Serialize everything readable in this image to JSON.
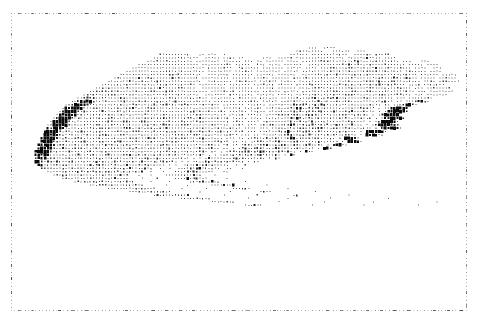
{
  "figure": {
    "title": "",
    "type": "dot-density-symbol-map",
    "subject": "Massachusetts",
    "background_color": "#ffffff",
    "symbol_color": "#0a0a0a",
    "frame_color": "#9a9a9a",
    "width": 485,
    "height": 326
  },
  "plot_frame": {
    "left": 11,
    "top": 13,
    "width": 456,
    "height": 298,
    "style": "dashed",
    "visible": true,
    "tick_count_horizontal": 34,
    "tick_count_vertical": 22
  },
  "grid": {
    "cell_width": 3.04,
    "cell_height": 3.35,
    "cols": 150,
    "rows": 89,
    "origin_x": 0,
    "origin_y": 0
  },
  "legend": {
    "visible": false,
    "levels": [
      {
        "code": 0,
        "label": "none",
        "size_ratio": 0.0
      },
      {
        "code": 1,
        "label": "very low",
        "size_ratio": 0.26
      },
      {
        "code": 2,
        "label": "low",
        "size_ratio": 0.4
      },
      {
        "code": 3,
        "label": "moderate",
        "size_ratio": 0.56
      },
      {
        "code": 4,
        "label": "high",
        "size_ratio": 0.74
      },
      {
        "code": 5,
        "label": "very high",
        "size_ratio": 1.0
      }
    ]
  },
  "axes": {
    "x_labels": [],
    "y_labels": [],
    "gridlines": false
  },
  "chart_data": {
    "type": "heatmap",
    "title": "",
    "xlabel": "",
    "ylabel": "",
    "legend_position": "none",
    "value_scale": [
      0,
      1,
      2,
      3,
      4,
      5
    ],
    "value_labels": [
      "none",
      "very low",
      "low",
      "moderate",
      "high",
      "very high"
    ],
    "cols": 150,
    "rows": 89,
    "notes": "Monochrome line-printer style population density symbol map of Massachusetts, including Cape Cod, Martha's Vineyard and Nantucket. Each grid cell value 0-5 encodes symbol size from blank to solid block.",
    "rows_rle": [
      "150:0",
      "150:0",
      "150:0",
      "150:0",
      "150:0",
      "150:0",
      "94:0,3:1,2:0,4:1,47:0",
      "90:0,9:1,3:0,6:1,2:0,3:1,37:0",
      "45:0,10:1,3:0,2:1,1:0,3:1,2:0,1:1,21:0,6:1,1:0,12:1,2:0,6:1,1:0,5:1,29:0",
      "43:0,12:1,1:2,2:1,2:0,5:1,1:0,4:1,1:0,2:1,6:0,3:1,2:0,5:1,1:0,16:1,1:0,5:1,2:2,4:1,1:0,4:1,20:0",
      "41:0,15:1,1:0,8:1,1:0,6:1,1:0,3:1,1:0,2:1,1:0,6:1,1:0,4:1,1:0,7:1,2:2,8:1,2:2,6:1,2:2,5:1,1:0,3:1,3:0,3:1,12:0",
      "38:0,20:1,1:0,10:1,1:0,5:1,2:0,3:1,1:0,4:1,1:0,6:1,2:0,4:1,1:2,6:1,1:2,1:1,2:2,5:1,1:2,4:1,3:2,4:1,1:0,5:1,1:0,4:1,8:0",
      "36:0,24:1,1:0,8:1,2:0,7:1,1:0,7:1,1:0,5:1,1:0,4:1,1:0,3:1,2:2,3:1,3:2,2:1,2:2,2:1,3:2,1:1,2:2,3:1,1:2,3:1,1:0,4:1,2:0,3:1,6:0",
      "34:0,13:1,1:2,12:1,1:0,8:1,1:0,6:1,1:0,8:1,1:0,5:1,1:0,3:1,1:2,4:1,2:2,2:1,1:2,2:1,1:2,3:1,2:2,2:1,2:2,2:1,1:2,2:1,1:2,2:1,1:0,7:1,1:0,4:1,4:0",
      "32:0,10:1,2:2,4:1,1:2,10:1,2:0,7:1,1:0,7:1,1:0,6:1,1:0,6:1,2:0,5:1,2:2,3:1,2:2,4:1,2:2,2:1,3:2,2:1,2:2,3:1,1:2,3:1,2:2,2:1,1:0,6:1,1:0,5:1,3:0",
      "30:0,8:1,1:2,2:1,2:2,6:1,1:2,8:1,1:0,9:1,1:0,6:1,1:0,5:1,1:0,6:1,1:0,4:1,1:2,4:1,1:2,3:1,2:2,3:1,2:2,3:1,1:2,4:1,2:2,2:1,2:2,3:1,2:2,2:1,1:0,5:1,1:0,6:1,2:0",
      "28:0,6:1,2:2,3:1,1:2,4:1,2:2,5:1,2:2,6:1,2:0,8:1,1:0,7:1,1:0,6:1,1:0,5:1,1:0,5:1,2:2,3:1,2:2,4:1,1:2,4:1,2:2,3:1,2:2,3:1,1:2,4:1,1:2,3:1,1:0,4:1,1:0,7:1,2:0",
      "26:0,5:1,1:2,2:1,3:2,3:1,2:2,4:1,1:2,3:1,2:2,5:1,1:0,9:1,1:0,7:1,1:0,7:1,1:0,5:1,1:0,4:1,2:2,4:1,2:2,3:1,2:2,4:1,2:2,3:1,2:2,3:1,2:2,3:1,1:0,4:1,1:0,7:1,2:0",
      "24:0,4:1,2:2,3:1,2:2,4:1,3:2,3:1,2:2,4:1,1:2,5:1,2:0,8:1,1:0,8:1,1:0,6:1,1:0,6:1,1:0,4:1,2:2,4:1,2:2,4:1,2:2,3:1,2:2,4:1,2:2,3:1,2:2,3:1,1:0,3:1,1:0,8:1,1:0",
      "22:0,3:1,3:2,2:1,2:2,4:1,2:2,4:1,2:2,3:1,3:2,4:1,1:2,6:1,1:0,8:1,1:0,7:1,1:0,6:1,1:0,5:1,1:0,4:1,1:2,4:1,3:2,3:1,3:2,3:1,2:2,4:1,2:2,4:1,2:2,2:1,1:0,3:1,1:0,8:1,1:0",
      "20:0,3:1,2:2,3:1,3:2,3:1,3:2,3:1,2:2,4:1,2:2,3:1,2:2,5:1,2:0,7:1,1:0,8:1,1:0,6:1,1:0,5:1,1:0,4:1,2:2,4:1,2:2,1:3,3:1,2:2,1:3,3:1,2:2,3:1,3:2,3:1,2:2,3:1,1:0,3:1,1:0,7:1,1:0",
      "18:0,2:1,1:3,2:4,1:3,2:1,2:2,3:1,3:2,3:1,3:2,3:1,2:2,4:1,2:2,4:1,1:2,5:1,1:0,8:1,1:0,6:1,1:0,6:1,1:0,4:1,2:2,3:1,2:2,1:3,3:1,2:2,2:3,2:1,3:2,2:1,3:2,3:1,2:2,3:1,1:0,3:1,1:0,5:1,2:2,1:1,0:0",
      "16:0,2:1,2:4,2:5,1:4,1:2,2:1,3:2,3:1,2:2,4:1,3:2,3:1,2:2,4:1,2:2,4:1,2:2,4:1,1:0,7:1,1:0,7:1,1:0,5:1,1:0,4:1,2:2,3:1,3:2,1:3,2:1,3:2,1:3,3:1,2:2,3:1,2:2,3:1,3:2,2:1,1:0,2:1,1:0,3:1,1:2,2:4,1:3,1:1,0:0",
      "14:0,2:1,1:3,2:5,2:4,1:3,2:1,2:2,4:1,2:2,4:1,2:2,3:1,3:2,3:1,2:2,4:1,2:2,4:1,1:2,5:1,1:0,7:1,1:0,6:1,1:0,4:1,1:2,3:1,3:2,2:3,2:1,2:2,2:3,2:1,3:2,3:1,2:2,3:1,2:2,3:1,1:0,2:1,1:0,2:1,2:3,2:5,1:4,1:1",
      "13:0,1:1,2:4,2:5,1:5,1:4,1:2,2:1,3:2,3:1,3:2,3:1,3:2,3:1,2:2,4:1,2:2,4:1,2:2,4:1,1:2,5:1,1:0,6:1,1:0,6:1,1:0,3:1,2:2,3:1,2:2,2:3,2:1,3:2,1:3,3:1,2:2,3:1,3:2,2:1,3:2,2:1,1:0,1:1,1:0,2:1,1:3,2:5,2:5,1:3",
      "12:0,1:1,1:3,2:5,2:5,1:3,1:1,2:2,3:1,3:2,3:1,3:2,3:1,3:2,3:1,3:2,3:1,2:2,4:1,2:2,4:1,2:2,4:1,1:0,6:1,1:0,5:1,1:0,3:1,2:2,2:1,3:2,1:3,2:1,3:2,2:3,2:1,3:2,2:1,3:2,2:1,3:2,2:1,1:0,1:1,1:0,1:1,2:4,2:5,2:5,1:2",
      "11:0,1:1,2:4,1:5,2:5,1:4,1:2,2:1,3:2,3:1,3:2,3:1,3:2,3:1,3:2,3:1,3:2,3:1,2:2,4:1,2:2,3:1,2:2,3:1,1:0,5:1,1:0,5:1,1:0,3:1,1:2,3:1,2:2,2:3,2:1,2:2,2:3,2:1,3:2,2:1,3:2,2:1,3:2,2:1,1:0,1:1,1:0,1:1,1:3,2:5,2:5,1:4,0:0",
      "10:0,1:1,1:3,2:5,2:5,1:4,1:1,2:2,3:1,3:2,2:1,3:2,3:1,3:2,3:1,3:2,3:1,3:2,3:1,3:2,3:1,2:2,3:1,2:2,3:1,1:0,5:1,1:0,4:1,1:0,3:1,2:2,2:1,3:2,2:3,2:1,3:2,1:3,2:1,3:2,2:1,3:2,2:1,3:2,2:1,1:0,1:1,1:0,1:1,2:4,2:5,2:5,1:3,0:0",
      "9:0,1:1,2:4,2:5,1:5,1:3,1:1,2:2,3:1,3:2,3:1,2:2,3:1,3:2,3:1,3:2,3:1,3:2,3:1,3:2,3:1,3:2,3:1,2:2,3:1,1:0,4:1,1:0,4:1,1:0,3:1,1:2,3:1,2:2,1:3,2:1,3:2,2:3,2:1,3:2,2:1,3:2,2:1,2:2,3:1,1:0,1:1,1:0,1:1,1:3,2:5,2:5,1:4,1:1",
      "8:0,1:1,1:3,2:5,2:5,1:4,1:2,2:1,2:2,3:1,3:2,3:1,3:2,3:1,3:2,2:1,3:2,3:1,3:2,3:1,3:2,3:1,2:2,3:1,2:2,3:1,1:0,4:1,1:0,3:1,1:0,3:1,2:2,2:1,3:2,2:3,2:1,3:2,1:3,2:1,3:2,2:1,3:2,2:1,2:2,2:1,1:0,1:1,1:0,1:1,2:4,2:5,2:5,1:3,1:1",
      "8:0,2:4,2:5,2:5,1:3,1:1,2:2,3:1,3:2,3:1,3:2,3:1,3:2,3:1,3:2,3:1,3:2,3:1,3:2,3:1,3:2,3:1,2:2,3:1,2:2,2:1,1:0,4:1,1:0,3:1,1:0,2:1,2:2,2:1,2:2,2:3,2:1,3:2,2:3,2:1,3:2,2:1,2:2,3:1,2:2,2:1,1:0,1:1,1:0,1:3,2:5,2:5,1:4,1:2,0:0",
      "7:0,1:3,2:5,2:5,1:4,1:1,2:2,2:1,3:2,3:1,3:2,3:1,3:2,3:1,3:2,3:1,3:2,3:1,3:2,3:1,3:2,2:1,3:2,2:1,2:2,3:1,1:0,3:1,1:0,3:1,1:0,2:1,2:2,2:1,3:2,1:3,2:1,3:2,2:3,2:1,2:2,3:1,2:2,2:1,2:2,2:1,1:0,1:1,1:0,1:4,2:5,2:5,1:3,1:1,0:0",
      "7:0,2:5,2:5,1:4,1:2,2:1,2:2,3:1,3:2,3:1,3:2,3:1,3:2,3:1,3:2,3:1,3:2,3:1,3:2,3:1,3:2,3:1,2:2,3:1,2:2,2:1,1:0,3:1,1:0,2:1,1:0,2:1,2:2,2:1,2:2,2:3,2:1,3:2,1:3,2:1,3:2,2:1,2:2,2:1,2:2,2:1,1:0,1:1,1:0,1:5,2:5,1:4,1:2,1:1,0:0",
      "6:0,1:4,2:5,2:5,1:3,1:1,2:2,2:1,3:2,3:1,3:2,3:1,3:2,3:1,3:2,3:1,3:2,3:1,3:2,2:1,3:2,2:1,3:2,2:1,2:2,2:1,1:0,3:1,1:0,2:1,1:0,2:1,2:2,2:1,3:2,1:3,2:1,2:2,2:3,2:1,2:2,2:1,2:2,2:1,2:2,1:1,1:0,1:1,1:0,1:5,2:5,1:3,1:2,0:0",
      "6:0,2:5,2:5,1:4,1:2,2:1,2:2,2:1,3:2,3:1,3:2,3:1,3:2,3:1,3:2,3:1,3:2,3:1,3:2,3:1,3:2,2:1,2:2,3:1,2:2,2:1,1:0,2:1,1:0,2:1,1:0,2:1,2:2,2:1,2:2,2:3,2:1,3:2,1:3,2:1,2:2,2:1,2:2,2:1,1:2,2:1,1:0,1:1,1:0,1:4,2:5,1:3,1:1,0:0",
      "5:0,1:3,2:5,2:5,1:3,1:1,2:2,2:1,3:2,2:1,3:2,3:1,3:2,3:1,3:2,3:1,3:2,3:1,3:2,3:1,2:2,3:1,3:2,2:1,2:2,2:1,1:0,2:1,1:0,2:1,1:0,1:1,2:2,2:1,2:2,2:3,2:1,2:2,2:3,2:1,2:2,2:1,2:2,1:1,2:2,1:1,1:0,1:1,1:0,1:3,2:5,1:2,1:1,0:0",
      "5:0,2:5,2:5,1:4,1:2,2:1,2:2,2:1,3:2,3:1,3:2,3:1,3:2,3:1,3:2,3:1,3:2,3:1,2:2,3:1,3:2,2:1,2:2,2:1,2:2,2:1,1:0,2:1,1:0,1:1,1:0,1:1,2:2,2:1,2:2,1:3,2:1,2:2,2:3,1:1,2:2,2:1,2:2,1:1,2:2,1:1,1:0,1:1,1:0,1:5,1:4,1:2,0:0",
      "4:0,1:4,2:5,2:5,1:3,1:1,2:2,2:1,2:2,3:1,3:2,3:1,3:2,3:1,3:2,3:1,3:2,2:1,3:2,3:1,2:2,3:1,2:2,2:1,2:2,1:1,1:0,2:1,1:0,1:1,1:0,1:1,2:2,1:1,2:2,2:3,1:1,2:2,2:3,1:1,2:2,1:1,2:2,1:1,2:2,1:1,1:0,1:1,1:0,1:5,1:3,1:1,0:0",
      "4:0,2:5,2:5,1:4,1:2,2:1,2:2,2:1,3:2,2:1,3:2,3:1,3:2,3:1,3:2,2:1,3:2,3:1,2:2,3:1,2:2,2:1,2:2,2:1,2:2,1:1,1:0,1:1,1:0,1:1,1:0,1:1,2:2,1:1,2:2,1:3,1:1,2:2,1:3,1:1,2:2,1:1,2:2,1:1,1:2,1:1,1:0,1:1,1:0,1:4,1:2,0:0",
      "4:0,1:3,2:5,1:4,1:2,1:1,2:2,2:1,2:2,2:1,3:2,3:1,3:2,2:1,3:2,3:1,2:2,3:1,2:2,2:1,2:2,2:1,2:2,2:1,1:2,2:1,1:0,1:1,1:0,1:1,1:0,1:1,1:2,2:1,1:2,2:3,1:1,2:2,1:3,1:1,1:2,2:1,1:2,2:1,1:2,1:1,1:0,1:1,1:0,1:3,1:1,0:0",
      "4:0,1:5,1:5,1:3,1:1,2:2,1:1,2:2,2:1,2:2,2:1,3:2,2:1,3:2,2:1,2:2,3:1,2:2,2:1,2:2,2:1,2:2,2:1,1:2,2:1,1:2,1:1,1:0,1:1,1:0,1:1,1:0,1:1,1:2,1:1,2:2,1:3,1:1,1:2,2:3,1:1,1:2,1:1,1:2,1:1,1:2,1:1,1:0,1:1,1:0,1:2,1:1,0:0",
      "5:0,1:4,1:3,1:1,1:2,1:1,2:2,1:1,2:2,2:1,2:2,2:1,2:2,2:1,2:2,2:1,2:2,2:1,2:2,2:1,2:2,1:1,2:2,1:1,1:2,1:1,1:2,1:1,1:0,1:1,1:0,1:1,2:0,1:1,1:2,1:1,1:2,1:3,1:1,1:2,1:3,1:1,1:2,1:1,1:2,1:1,1:2,1:1,2:0,1:1,2:0,1:1,0:0",
      "6:0,1:2,1:1,1:2,1:1,1:2,1:1,2:2,1:1,2:2,1:1,2:2,2:1,2:2,1:1,2:2,2:1,2:2,1:1,2:2,1:1,2:2,1:1,1:2,1:1,1:2,1:1,1:2,2:0,1:1,2:0,1:1,2:0,1:1,1:2,1:1,1:2,1:3,1:1,1:2,1:3,1:1,1:2,1:1,1:2,1:1,1:2,2:0,2:1,3:0,1:1,0:0",
      "8:0,1:1,1:2,1:1,1:2,1:1,1:2,1:1,2:2,1:1,2:2,1:1,2:2,1:1,2:2,1:1,2:2,1:1,2:2,1:1,1:2,1:1,1:2,1:1,1:2,1:1,1:2,2:0,1:1,3:0,1:1,3:0,1:1,1:2,1:1,1:2,1:3,1:1,1:2,1:3,1:1,1:2,1:1,1:2,1:1,3:0,2:1,5:0,0:0",
      "10:0,1:1,1:2,1:1,1:2,1:1,1:2,1:1,1:2,1:1,1:2,1:1,2:2,1:1,1:2,1:1,1:2,1:1,1:2,1:1,1:2,1:1,1:2,1:1,1:2,3:0,1:1,3:0,1:1,4:0,1:1,1:2,1:1,1:2,1:3,1:1,1:2,1:3,1:1,1:2,1:1,1:2,4:0,1:1,7:0,0:0",
      "13:0,1:1,1:2,1:1,1:2,1:1,1:2,1:1,1:2,1:1,1:2,1:1,1:2,1:1,1:2,1:1,1:2,1:1,1:2,1:1,1:2,1:1,1:2,4:0,1:1,4:0,1:1,5:0,1:1,1:2,1:1,1:2,1:3,1:1,1:2,1:3,1:1,1:2,1:1,6:0,1:1,9:0,0:0",
      "17:0,1:1,1:2,1:1,1:2,1:1,1:2,1:1,1:2,1:1,1:2,1:1,1:2,1:1,1:2,1:1,1:2,1:1,1:2,1:1,1:2,5:0,1:1,5:0,1:1,6:0,1:1,1:2,1:1,1:2,1:3,1:1,1:2,1:3,1:1,1:2,8:0,1:1,11:0,0:0",
      "22:0,1:1,1:2,1:1,1:2,1:1,1:2,1:1,1:2,1:1,1:2,1:1,1:2,1:1,1:2,1:1,1:2,1:1,1:2,7:0,1:1,6:0,1:1,7:0,1:1,1:2,1:1,1:2,1:3,1:1,1:2,1:3,10:0,1:1,13:0,0:0",
      "28:0,1:1,1:2,1:1,1:2,1:1,1:2,1:1,1:2,1:1,1:2,1:1,1:2,1:1,1:2,1:1,1:2,8:0,1:1,7:0,1:1,8:0,1:1,1:2,1:1,1:2,1:3,1:1,12:0,1:1,15:0,0:0",
      "35:0,1:1,1:2,1:1,1:2,1:1,1:2,1:1,1:2,1:1,1:2,1:1,1:2,1:1,1:2,9:0,1:1,9:0,1:1,9:0,1:1,1:2,1:1,1:2,14:0,1:1,17:0,0:0",
      "43:0,1:1,1:2,1:1,1:2,1:1,1:2,1:1,1:2,1:1,1:2,1:1,1:2,11:0,1:1,10:0,1:1,11:0,1:1,1:2,16:0,1:1,19:0,0:0",
      "52:0,1:1,1:2,1:1,1:2,1:1,1:2,1:1,1:2,1:1,1:2,12:0,1:1,12:0,1:1,13:0,1:1,18:0,1:1,21:0,0:0",
      "62:0,1:1,1:2,1:1,1:2,1:1,1:2,1:1,1:2,14:0,1:1,14:0,1:1,15:0,1:1,20:0,1:1,23:0,0:0",
      "73:0,1:1,1:2,1:1,1:2,1:1,1:2,16:0,1:1,16:0,1:1,17:0,1:1,22:0,1:1,18:0,0:0",
      "150:0",
      "150:0",
      "150:0",
      "150:0",
      "150:0",
      "150:0",
      "150:0",
      "150:0",
      "150:0",
      "150:0",
      "150:0",
      "150:0",
      "150:0",
      "150:0",
      "150:0",
      "150:0",
      "150:0",
      "150:0",
      "150:0",
      "150:0",
      "150:0",
      "150:0",
      "150:0",
      "150:0",
      "150:0",
      "150:0",
      "150:0",
      "150:0",
      "150:0",
      "150:0",
      "150:0",
      "150:0",
      "150:0",
      "150:0",
      "150:0",
      "150:0",
      "150:0",
      "150:0"
    ],
    "regions": [
      {
        "name": "Berkshires (west)",
        "density": "low",
        "col_range": [
          4,
          24
        ],
        "row_range": [
          10,
          44
        ]
      },
      {
        "name": "Pioneer Valley",
        "density": "moderate",
        "col_range": [
          24,
          48
        ],
        "row_range": [
          8,
          46
        ]
      },
      {
        "name": "Worcester County",
        "density": "moderate",
        "col_range": [
          48,
          82
        ],
        "row_range": [
          6,
          48
        ]
      },
      {
        "name": "Greater Boston",
        "density": "very high",
        "col_range": [
          88,
          118
        ],
        "row_range": [
          8,
          46
        ]
      },
      {
        "name": "North Shore / Cape Ann",
        "density": "high",
        "col_range": [
          100,
          125
        ],
        "row_range": [
          4,
          16
        ]
      },
      {
        "name": "South Shore",
        "density": "moderate",
        "col_range": [
          92,
          118
        ],
        "row_range": [
          44,
          58
        ]
      },
      {
        "name": "Bristol / New Bedford",
        "density": "high",
        "col_range": [
          72,
          96
        ],
        "row_range": [
          48,
          62
        ]
      },
      {
        "name": "Cape Cod",
        "density": "low",
        "col_range": [
          108,
          142
        ],
        "row_range": [
          48,
          66
        ]
      },
      {
        "name": "Martha's Vineyard",
        "density": "very low",
        "col_range": [
          104,
          120
        ],
        "row_range": [
          70,
          80
        ]
      },
      {
        "name": "Nantucket",
        "density": "very low",
        "col_range": [
          134,
          146
        ],
        "row_range": [
          74,
          82
        ]
      }
    ]
  },
  "rendering": {
    "seed": 20231117,
    "dither_amount": 0.38,
    "symbol_shapes": [
      "blank",
      "dot",
      "small-square",
      "medium-square",
      "large-square",
      "solid-block"
    ]
  }
}
